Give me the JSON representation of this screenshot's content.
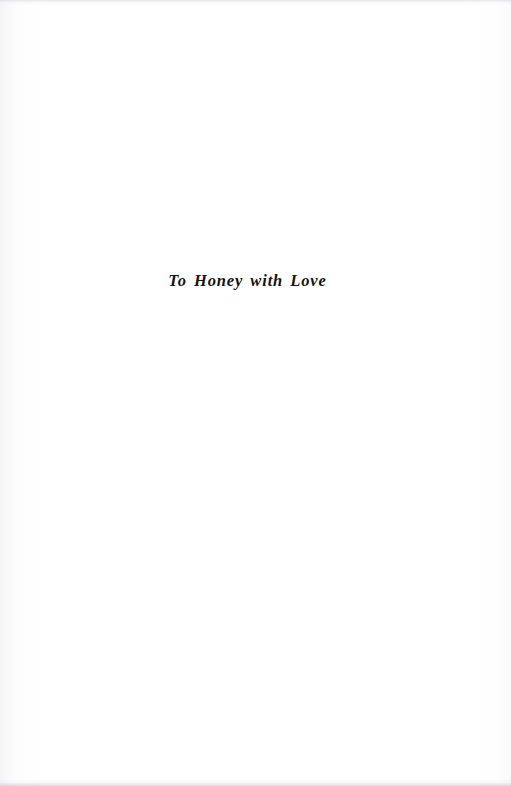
{
  "page": {
    "kind": "book-dedication-page",
    "background_color": "#ffffff",
    "ink_color": "#141414",
    "width": 511,
    "height": 786
  },
  "dedication": {
    "text": "To Honey with Love"
  }
}
